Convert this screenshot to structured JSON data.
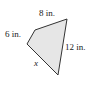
{
  "figure": {
    "type": "quadrilateral",
    "fill_color": "#e6e6e6",
    "stroke_color": "#333333",
    "sides": [
      {
        "label": "8 in.",
        "position": "top"
      },
      {
        "label": "12 in.",
        "position": "right"
      },
      {
        "label": "x",
        "position": "bottom-left"
      },
      {
        "label": "6 in.",
        "position": "left"
      }
    ]
  }
}
